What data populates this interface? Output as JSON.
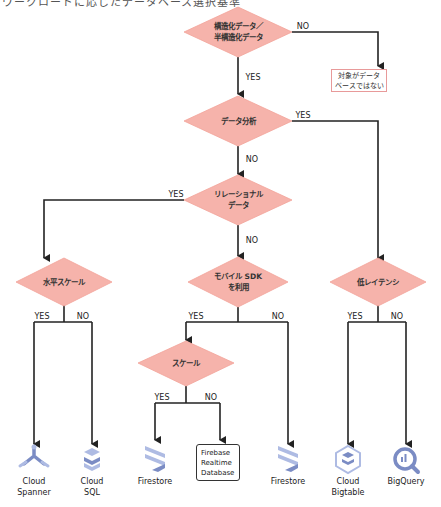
{
  "header": {
    "caption": "ワークロードに応じたデータベース選択基準"
  },
  "nodes": {
    "structured": {
      "label": "構造化データ／\n半構造化データ"
    },
    "not_db": {
      "label": "対象がデータ\nベースではない"
    },
    "analytics": {
      "label": "データ分析"
    },
    "relational": {
      "label": "リレーショナル\nデータ"
    },
    "horizontal_scale": {
      "label": "水平スケール"
    },
    "mobile_sdk": {
      "label": "モバイル SDK\nを利用"
    },
    "low_latency": {
      "label": "低レイテンシ"
    },
    "scale": {
      "label": "スケール"
    },
    "firebase_rtdb": {
      "label": "Firebase\nRealtime\nDatabase"
    }
  },
  "edges": {
    "yes": "YES",
    "no": "NO"
  },
  "products": [
    {
      "name": "Cloud\nSpanner",
      "icon": "cloud-spanner-icon"
    },
    {
      "name": "Cloud\nSQL",
      "icon": "cloud-sql-icon"
    },
    {
      "name": "Firestore",
      "icon": "firestore-icon"
    },
    {
      "name": "Firestore",
      "icon": "firestore-icon"
    },
    {
      "name": "Cloud\nBigtable",
      "icon": "cloud-bigtable-icon"
    },
    {
      "name": "BigQuery",
      "icon": "bigquery-icon"
    }
  ],
  "colors": {
    "diamond_fill": "#f6b3ab",
    "line": "#222222",
    "icon_blue": "#7b8cc4",
    "icon_light": "#aebbe3",
    "box_border": "#e89a9a"
  }
}
